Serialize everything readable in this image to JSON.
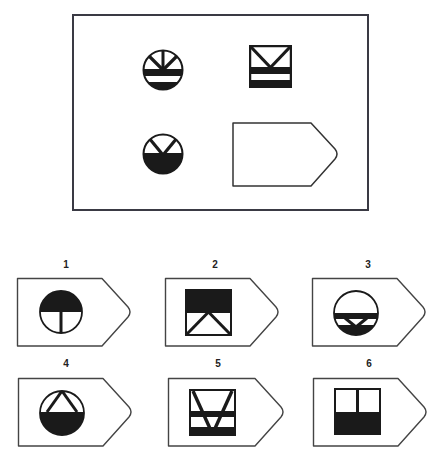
{
  "puzzle": {
    "type": "matrix-reasoning",
    "matrix": {
      "cells": [
        {
          "position": "top-left",
          "shape": "circle",
          "description": "circle with three-spoke Y (V plus vertical) at top, thick black horizontal band, white band, black bottom segment"
        },
        {
          "position": "top-right",
          "shape": "square",
          "description": "square with V at top, thick black horizontal band, white band, black bottom band"
        },
        {
          "position": "bottom-left",
          "shape": "circle",
          "description": "circle with V at top and black lower half"
        },
        {
          "position": "bottom-right",
          "shape": "empty-answer-slot",
          "description": "empty pentagon arrow shape"
        }
      ]
    },
    "options": [
      {
        "label": "1",
        "shape": "circle",
        "description": "circle with black upper half and vertical line in lower white half"
      },
      {
        "label": "2",
        "shape": "square",
        "description": "square with black upper half and inverted V (A) in lower white half"
      },
      {
        "label": "3",
        "shape": "circle",
        "description": "circle with white top, black band, small V in black lower part"
      },
      {
        "label": "4",
        "shape": "circle",
        "description": "circle with inverted V (A) at top and black lower half"
      },
      {
        "label": "5",
        "shape": "square",
        "description": "square with large V, two black horizontal bands"
      },
      {
        "label": "6",
        "shape": "square",
        "description": "square with vertical line in upper white half and black lower half"
      }
    ]
  },
  "colors": {
    "ink": "#1a1a1a",
    "outline": "#555555",
    "frame": "#333333",
    "background": "#ffffff"
  }
}
